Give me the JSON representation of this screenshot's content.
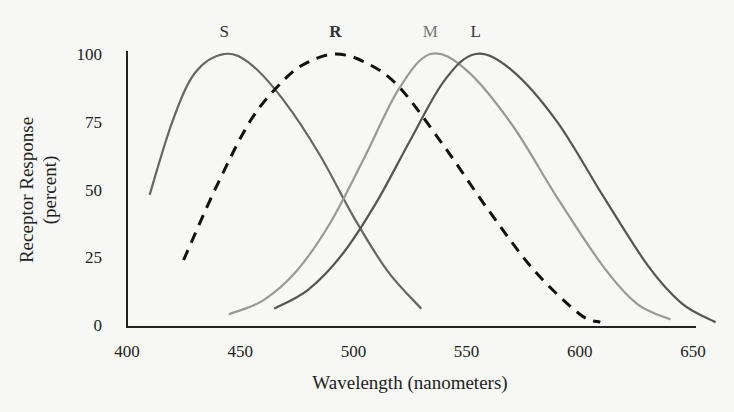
{
  "chart_data": {
    "type": "line",
    "title": "",
    "xlabel": "Wavelength (nanometers)",
    "ylabel": [
      "Receptor Response",
      "(percent)"
    ],
    "xlim": [
      400,
      650
    ],
    "ylim": [
      0,
      100
    ],
    "xticks": [
      400,
      450,
      500,
      550,
      600,
      650
    ],
    "yticks": [
      0,
      25,
      50,
      75,
      100
    ],
    "grid": false,
    "legend": "inline labels above peaks",
    "series": [
      {
        "name": "S",
        "style": "solid",
        "color": "#666666",
        "peak_nm": 443,
        "start_nm": 410,
        "end_nm": 530,
        "x": [
          410,
          420,
          430,
          443,
          455,
          470,
          485,
          500,
          515,
          530
        ],
        "y": [
          48,
          75,
          93,
          100,
          96,
          82,
          63,
          40,
          20,
          6
        ]
      },
      {
        "name": "R",
        "style": "dashed",
        "color": "#111111",
        "peak_nm": 492,
        "start_nm": 425,
        "end_nm": 609,
        "x": [
          425,
          440,
          455,
          470,
          480,
          492,
          505,
          520,
          540,
          560,
          580,
          600,
          609
        ],
        "y": [
          24,
          52,
          76,
          91,
          97,
          100,
          97,
          88,
          66,
          42,
          20,
          4,
          1
        ]
      },
      {
        "name": "M",
        "style": "solid",
        "color": "#999999",
        "peak_nm": 534,
        "start_nm": 445,
        "end_nm": 640,
        "x": [
          445,
          460,
          475,
          490,
          505,
          520,
          534,
          550,
          570,
          590,
          610,
          625,
          640
        ],
        "y": [
          4,
          9,
          20,
          38,
          62,
          87,
          100,
          94,
          74,
          47,
          22,
          8,
          2
        ]
      },
      {
        "name": "L",
        "style": "solid",
        "color": "#555555",
        "peak_nm": 554,
        "start_nm": 465,
        "end_nm": 660,
        "x": [
          465,
          480,
          495,
          510,
          525,
          540,
          554,
          570,
          590,
          610,
          630,
          645,
          660
        ],
        "y": [
          6,
          13,
          26,
          45,
          68,
          90,
          100,
          94,
          75,
          48,
          22,
          8,
          1
        ]
      }
    ]
  }
}
